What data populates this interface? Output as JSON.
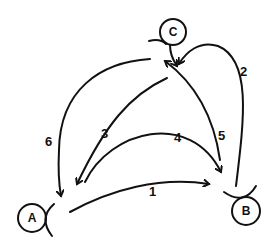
{
  "diagram": {
    "type": "state-transition",
    "nodes": [
      {
        "id": "A",
        "label": "A"
      },
      {
        "id": "B",
        "label": "B"
      },
      {
        "id": "C",
        "label": "C"
      }
    ],
    "edges": [
      {
        "label": "1",
        "from": "A",
        "to": "B"
      },
      {
        "label": "2",
        "from": "B",
        "to": "C"
      },
      {
        "label": "3",
        "from": "C",
        "to": "A"
      },
      {
        "label": "4",
        "from": "A",
        "to": "B"
      },
      {
        "label": "5",
        "from": "B",
        "to": "C"
      },
      {
        "label": "6",
        "from": "C",
        "to": "A"
      }
    ],
    "colors": {
      "ink": "#111111",
      "background": "#ffffff"
    }
  }
}
